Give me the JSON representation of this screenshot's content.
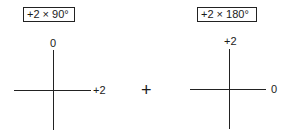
{
  "diagrams": [
    {
      "label": "+2 × 90°",
      "axis_top_label": "0",
      "axis_right_label": "+2"
    },
    {
      "label": "+2 × 180°",
      "axis_top_label": "+2",
      "axis_right_label": "0"
    }
  ],
  "operator": "+"
}
